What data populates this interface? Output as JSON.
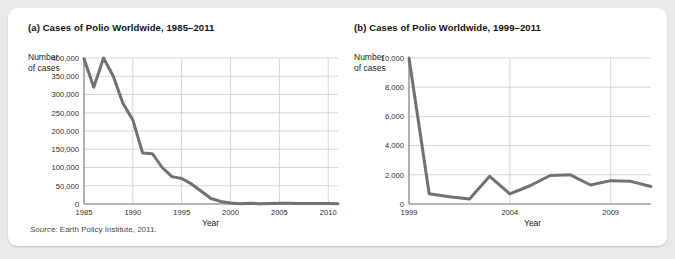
{
  "source_note": {
    "prefix": "Source:",
    "text": " Earth Policy Institute, 2011."
  },
  "panels": [
    {
      "title": "(a) Cases of Polio Worldwide, 1985–2011",
      "y_axis_label_line1": "Number",
      "y_axis_label_line2": "of cases",
      "x_axis_title": "Year"
    },
    {
      "title": "(b) Cases of Polio Worldwide, 1999–2011",
      "y_axis_label_line1": "Number",
      "y_axis_label_line2": "of cases",
      "x_axis_title": "Year"
    }
  ],
  "colors": {
    "line": "#6f7173",
    "grid": "#c9cbcc",
    "axis": "#6d6f71",
    "card_bg": "#ffffff",
    "page_bg": "#e9eaea",
    "text": "#111111"
  },
  "chart_data": [
    {
      "type": "line",
      "title": "(a) Cases of Polio Worldwide, 1985–2011",
      "xlabel": "Year",
      "ylabel": "Number of cases",
      "xlim": [
        1985,
        2011
      ],
      "ylim": [
        0,
        400000
      ],
      "xticks": [
        1985,
        1990,
        1995,
        2000,
        2005,
        2010
      ],
      "xticklabels": [
        "1985",
        "1990",
        "1995",
        "2000",
        "2005",
        "2010"
      ],
      "yticks": [
        0,
        50000,
        100000,
        150000,
        200000,
        250000,
        300000,
        350000,
        400000
      ],
      "yticklabels": [
        "0",
        "50,000",
        "100,000",
        "150,000",
        "200,000",
        "250,000",
        "300,000",
        "350,000",
        "400,000"
      ],
      "grid": true,
      "legend": null,
      "x": [
        1985,
        1986,
        1987,
        1988,
        1989,
        1990,
        1991,
        1992,
        1993,
        1994,
        1995,
        1996,
        1997,
        1998,
        1999,
        2000,
        2001,
        2002,
        2003,
        2004,
        2005,
        2006,
        2007,
        2008,
        2009,
        2010,
        2011
      ],
      "values": [
        398000,
        320000,
        400000,
        350000,
        275000,
        230000,
        140000,
        138000,
        100000,
        75000,
        70000,
        55000,
        35000,
        15000,
        7000,
        3000,
        1000,
        1900,
        800,
        1200,
        2000,
        2000,
        1400,
        1700,
        1600,
        1300,
        600
      ]
    },
    {
      "type": "line",
      "title": "(b) Cases of Polio Worldwide, 1999–2011",
      "xlabel": "Year",
      "ylabel": "Number of cases",
      "xlim": [
        1999,
        2011
      ],
      "ylim": [
        0,
        10000
      ],
      "xticks": [
        1999,
        2004,
        2009
      ],
      "xticklabels": [
        "1999",
        "2004",
        "2009"
      ],
      "yticks": [
        0,
        2000,
        4000,
        6000,
        8000,
        10000
      ],
      "yticklabels": [
        "0",
        "2,000",
        "4,000",
        "6,000",
        "8,000",
        "10,000"
      ],
      "grid": true,
      "legend": null,
      "x": [
        1999,
        2000,
        2001,
        2002,
        2003,
        2004,
        2005,
        2006,
        2007,
        2008,
        2009,
        2010,
        2011
      ],
      "values": [
        10000,
        700,
        500,
        350,
        1900,
        700,
        1250,
        1950,
        2000,
        1300,
        1600,
        1550,
        1200,
        500
      ]
    }
  ]
}
